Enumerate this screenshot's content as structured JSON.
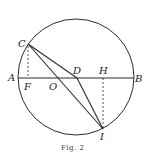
{
  "figure": {
    "caption": "Fig. 2",
    "stroke_color": "#2a2a2a"
  },
  "points": {
    "A": {
      "label": "A",
      "x": 18,
      "y": 78
    },
    "B": {
      "label": "B",
      "x": 134,
      "y": 78
    },
    "C": {
      "label": "C",
      "x": 28,
      "y": 44
    },
    "D": {
      "label": "D",
      "x": 77,
      "y": 78
    },
    "F": {
      "label": "F",
      "x": 28,
      "y": 78
    },
    "H": {
      "label": "H",
      "x": 103,
      "y": 78
    },
    "I": {
      "label": "I",
      "x": 103,
      "y": 129
    },
    "O": {
      "label": "O",
      "x": 57,
      "y": 78
    }
  },
  "circle": {
    "cx": 76,
    "cy": 77,
    "r": 58
  },
  "segments": [
    {
      "from": "A",
      "to": "B",
      "style": "solid"
    },
    {
      "from": "C",
      "to": "D",
      "style": "solid"
    },
    {
      "from": "C",
      "to": "I",
      "style": "solid"
    },
    {
      "from": "D",
      "to": "I",
      "style": "solid"
    },
    {
      "from": "C",
      "to": "F",
      "style": "dashed"
    },
    {
      "from": "H",
      "to": "I",
      "style": "dashed"
    }
  ]
}
